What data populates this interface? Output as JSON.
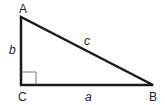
{
  "diagram": {
    "type": "right-triangle",
    "vertices": {
      "A": {
        "label": "A"
      },
      "B": {
        "label": "B"
      },
      "C": {
        "label": "C"
      }
    },
    "sides": {
      "a": {
        "label": "a"
      },
      "b": {
        "label": "b"
      },
      "c": {
        "label": "c"
      }
    },
    "right_angle_at": "C",
    "stroke_color": "#1a1a1a"
  }
}
